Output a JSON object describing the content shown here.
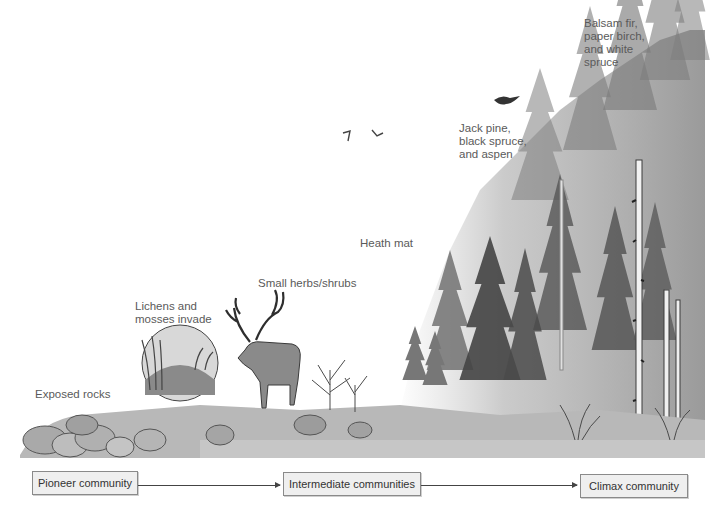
{
  "diagram": {
    "type": "ecological-succession",
    "stage_labels": [
      {
        "id": "exposed-rocks",
        "text": "Exposed rocks"
      },
      {
        "id": "lichens-mosses",
        "text": "Lichens and\nmosses invade"
      },
      {
        "id": "small-herbs",
        "text": "Small herbs/shrubs"
      },
      {
        "id": "heath-mat",
        "text": "Heath mat"
      },
      {
        "id": "jack-pine",
        "text": "Jack pine,\nblack spruce,\nand aspen"
      },
      {
        "id": "balsam-fir",
        "text": "Balsam fir,\npaper birch,\nand white\nspruce"
      }
    ],
    "flow": {
      "boxes": [
        {
          "id": "pioneer",
          "text": "Pioneer community"
        },
        {
          "id": "intermediate",
          "text": "Intermediate communities"
        },
        {
          "id": "climax",
          "text": "Climax community"
        }
      ],
      "arrows": [
        {
          "from": "pioneer",
          "to": "intermediate"
        },
        {
          "from": "intermediate",
          "to": "climax"
        }
      ]
    },
    "illustration": {
      "elements": [
        "rocks",
        "magnified-lichen-moss-circle",
        "caribou",
        "shrubs",
        "conifer-forest",
        "birch-trees",
        "birds"
      ],
      "palette": {
        "ink": "#3a3a3a",
        "mid": "#8c8c8c",
        "light": "#c8c8c8",
        "ground": "#b5b5b5"
      }
    }
  }
}
